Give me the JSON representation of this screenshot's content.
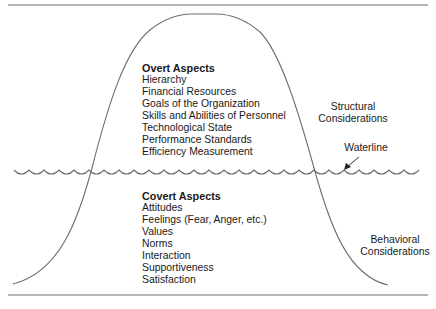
{
  "diagram": {
    "type": "iceberg",
    "overt": {
      "heading": "Overt Aspects",
      "items": [
        "Hierarchy",
        "Financial Resources",
        "Goals of the Organization",
        "Skills and Abilities of Personnel",
        "Technological State",
        "Performance Standards",
        "Efficiency Measurement"
      ],
      "side_label_line1": "Structural",
      "side_label_line2": "Considerations"
    },
    "covert": {
      "heading": "Covert Aspects",
      "items": [
        "Attitudes",
        "Feelings (Fear, Anger, etc.)",
        "Values",
        "Norms",
        "Interaction",
        "Supportiveness",
        "Satisfaction"
      ],
      "side_label_line1": "Behavioral",
      "side_label_line2": "Considerations"
    },
    "waterline_label": "Waterline",
    "line_color": "#6e6e6e"
  }
}
